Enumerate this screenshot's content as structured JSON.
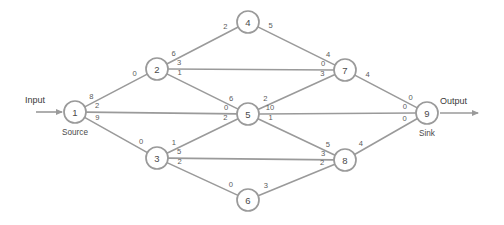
{
  "chart_data": {
    "type": "diagram",
    "title": "",
    "subtitle": "",
    "xlabel": "",
    "ylabel": "",
    "grid": false,
    "legend": "none",
    "diagram_kind": "network-flow-graph",
    "input_label": "Input",
    "output_label": "Output",
    "source_label": "Source",
    "sink_label": "Sink",
    "node_radius": 11,
    "nodes": [
      {
        "id": "1",
        "label": "1",
        "x": 75,
        "y": 112,
        "role": "Source"
      },
      {
        "id": "2",
        "label": "2",
        "x": 157,
        "y": 69,
        "role": ""
      },
      {
        "id": "3",
        "label": "3",
        "x": 157,
        "y": 158,
        "role": ""
      },
      {
        "id": "4",
        "label": "4",
        "x": 248,
        "y": 22,
        "role": ""
      },
      {
        "id": "5",
        "label": "5",
        "x": 248,
        "y": 114,
        "role": ""
      },
      {
        "id": "6",
        "label": "6",
        "x": 248,
        "y": 200,
        "role": ""
      },
      {
        "id": "7",
        "label": "7",
        "x": 345,
        "y": 70,
        "role": ""
      },
      {
        "id": "8",
        "label": "8",
        "x": 345,
        "y": 160,
        "role": ""
      },
      {
        "id": "9",
        "label": "9",
        "x": 427,
        "y": 113,
        "role": "Sink"
      }
    ],
    "edges": [
      {
        "from": "1",
        "to": "2",
        "tail_value": "8",
        "head_value": "0"
      },
      {
        "from": "1",
        "to": "5",
        "tail_value": "2",
        "head_value": "0"
      },
      {
        "from": "1",
        "to": "3",
        "tail_value": "9",
        "head_value": "0"
      },
      {
        "from": "2",
        "to": "4",
        "tail_value": "6",
        "head_value": "2"
      },
      {
        "from": "2",
        "to": "7",
        "tail_value": "3",
        "head_value": "0"
      },
      {
        "from": "2",
        "to": "5",
        "tail_value": "1",
        "head_value": "6"
      },
      {
        "from": "3",
        "to": "5",
        "tail_value": "1",
        "head_value": "2"
      },
      {
        "from": "3",
        "to": "8",
        "tail_value": "5",
        "head_value": "3"
      },
      {
        "from": "3",
        "to": "6",
        "tail_value": "2",
        "head_value": "0"
      },
      {
        "from": "4",
        "to": "7",
        "tail_value": "5",
        "head_value": "4"
      },
      {
        "from": "5",
        "to": "7",
        "tail_value": "2",
        "head_value": "3"
      },
      {
        "from": "5",
        "to": "9",
        "tail_value": "10",
        "head_value": "0"
      },
      {
        "from": "5",
        "to": "8",
        "tail_value": "1",
        "head_value": "5"
      },
      {
        "from": "6",
        "to": "8",
        "tail_value": "3",
        "head_value": "2"
      },
      {
        "from": "7",
        "to": "9",
        "tail_value": "4",
        "head_value": "0"
      },
      {
        "from": "8",
        "to": "9",
        "tail_value": "4",
        "head_value": "0"
      }
    ],
    "input_arrow": {
      "x1": 36,
      "y1": 112,
      "x2": 62,
      "y2": 112
    },
    "output_arrow": {
      "x1": 440,
      "y1": 113,
      "x2": 478,
      "y2": 113
    },
    "input_text_pos": {
      "x": 45,
      "y": 100
    },
    "output_text_pos": {
      "x": 440,
      "y": 101
    }
  },
  "colors": {
    "stroke": "#9a9a9a",
    "text": "#4a4a4a",
    "label_text": "#5a5a5a",
    "background": "#ffffff"
  }
}
